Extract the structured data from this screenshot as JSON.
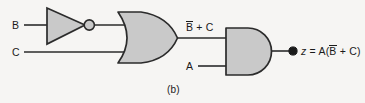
{
  "figure": {
    "caption": "(b)",
    "background_color": "#f6f5f3",
    "gate_fill_color": "#c9c9c9",
    "stroke_color": "#2b2b2b",
    "text_color": "#1a1a1a"
  },
  "labels": {
    "input_b": "B",
    "input_c": "C",
    "input_a": "A",
    "intermediate_prefix": "",
    "intermediate_overbar": "B",
    "intermediate_suffix": " + C",
    "output_var": "z",
    "output_eq": " = A(",
    "output_overbar": "B",
    "output_suffix": " + C)"
  },
  "circuit": {
    "type": "logic-diagram",
    "expression": "z = A(B' + C)",
    "gates": [
      {
        "id": "not-gate-1",
        "name": "NOT",
        "inputs": [
          "B"
        ],
        "output": "B'",
        "x": 47,
        "y": 8,
        "width": 38,
        "height": 36,
        "bubble_cx": 89,
        "bubble_cy": 25,
        "bubble_r": 5
      },
      {
        "id": "or-gate-1",
        "name": "OR",
        "inputs": [
          "B'",
          "C"
        ],
        "output": "B' + C",
        "x": 118,
        "y": 12,
        "width": 60,
        "height": 51
      },
      {
        "id": "and-gate-1",
        "name": "AND",
        "inputs": [
          "B' + C",
          "A"
        ],
        "output": "z",
        "x": 226,
        "y": 28,
        "width": 45,
        "height": 47
      }
    ],
    "wires": [
      {
        "id": "wire-b-in",
        "from": "B",
        "to": "not-gate-1",
        "y": 25
      },
      {
        "id": "wire-c-in",
        "from": "C",
        "to": "or-gate-1",
        "y": 52
      },
      {
        "id": "wire-not-or",
        "from": "not-gate-1",
        "to": "or-gate-1",
        "y": 25
      },
      {
        "id": "wire-or-and",
        "from": "or-gate-1",
        "to": "and-gate-1",
        "y": 38
      },
      {
        "id": "wire-a-in",
        "from": "A",
        "to": "and-gate-1",
        "y": 66
      },
      {
        "id": "wire-out",
        "from": "and-gate-1",
        "to": "z",
        "y": 51
      }
    ],
    "output_node": {
      "cx": 293,
      "cy": 51,
      "r": 4
    }
  }
}
